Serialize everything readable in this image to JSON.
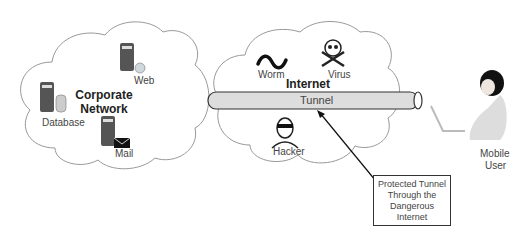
{
  "corporate_network": {
    "title": "Corporate Network",
    "servers": [
      {
        "name": "Web",
        "icon": "web-server-icon"
      },
      {
        "name": "Database",
        "icon": "database-server-icon"
      },
      {
        "name": "Mail",
        "icon": "mail-server-icon"
      }
    ]
  },
  "internet": {
    "title": "Internet",
    "threats": [
      {
        "name": "Worm",
        "icon": "worm-icon"
      },
      {
        "name": "Virus",
        "icon": "skull-crossbones-icon"
      },
      {
        "name": "Hacker",
        "icon": "hacker-icon"
      }
    ]
  },
  "tunnel": {
    "label": "Tunnel"
  },
  "mobile_user": {
    "line1": "Mobile",
    "line2": "User"
  },
  "callout": {
    "lines": [
      "Protected Tunnel",
      "Through the",
      "Dangerous",
      "Internet"
    ]
  },
  "colors": {
    "cloud_stroke": "#999999",
    "tunnel_fill": "#dddddd",
    "tunnel_stroke": "#333333",
    "text": "#444444"
  }
}
